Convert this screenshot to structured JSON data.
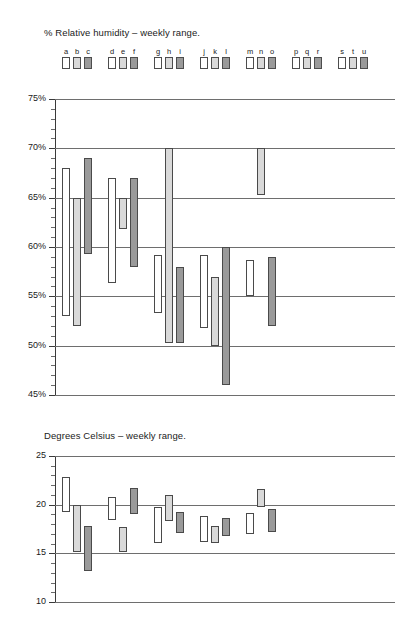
{
  "page": {
    "background": "#ffffff",
    "width": 405,
    "height": 622
  },
  "legend": {
    "name": "series-legend",
    "groups": [
      {
        "letters": [
          "a",
          "b",
          "c"
        ]
      },
      {
        "letters": [
          "d",
          "e",
          "f"
        ]
      },
      {
        "letters": [
          "g",
          "h",
          "i"
        ]
      },
      {
        "letters": [
          "j",
          "k",
          "l"
        ]
      },
      {
        "letters": [
          "m",
          "n",
          "o"
        ]
      },
      {
        "letters": [
          "p",
          "q",
          "r"
        ]
      },
      {
        "letters": [
          "s",
          "t",
          "u"
        ]
      }
    ],
    "swatch_colors": [
      "#ffffff",
      "#d9d9d9",
      "#9a9a9a"
    ],
    "swatch_border": "#4d4d4d"
  },
  "colors": {
    "white_series": "#ffffff",
    "light_series": "#d9d9d9",
    "dark_series": "#9a9a9a",
    "bar_border": "#4a4a4a",
    "gridline": "#6e6e6e",
    "axis": "#3a3a3a",
    "text": "#1a1a1a"
  },
  "chart_data": [
    {
      "id": "humidity",
      "type": "bar",
      "title": "% Relative humidity – weekly range.",
      "xlabel": "",
      "ylabel": "",
      "ylim": [
        45,
        75
      ],
      "ytick_labels": [
        "75%",
        "70%",
        "65%",
        "60%",
        "55%",
        "50%",
        "45%"
      ],
      "ytick_values": [
        75,
        70,
        65,
        60,
        55,
        50,
        45
      ],
      "yminor_step": 1,
      "grid": true,
      "legend_position": "top",
      "note": "Floating range bars: each bar spans from its low to its high value. Categories p, q, r, s, t, u have no data plotted.",
      "categories": [
        "a",
        "b",
        "c",
        "d",
        "e",
        "f",
        "g",
        "h",
        "i",
        "j",
        "k",
        "l",
        "m",
        "n",
        "o",
        "p",
        "q",
        "r",
        "s",
        "t",
        "u"
      ],
      "series_colors": {
        "a": "#ffffff",
        "b": "#d9d9d9",
        "c": "#9a9a9a",
        "d": "#ffffff",
        "e": "#d9d9d9",
        "f": "#9a9a9a",
        "g": "#ffffff",
        "h": "#d9d9d9",
        "i": "#9a9a9a",
        "j": "#ffffff",
        "k": "#d9d9d9",
        "l": "#9a9a9a",
        "m": "#ffffff",
        "n": "#d9d9d9",
        "o": "#9a9a9a",
        "p": "#ffffff",
        "q": "#d9d9d9",
        "r": "#9a9a9a",
        "s": "#ffffff",
        "t": "#d9d9d9",
        "u": "#9a9a9a"
      },
      "ranges": [
        {
          "category": "a",
          "low": 53.0,
          "high": 68.0,
          "color": "#ffffff"
        },
        {
          "category": "b",
          "low": 52.0,
          "high": 65.0,
          "color": "#d9d9d9"
        },
        {
          "category": "c",
          "low": 59.3,
          "high": 69.0,
          "color": "#9a9a9a"
        },
        {
          "category": "d",
          "low": 56.3,
          "high": 67.0,
          "color": "#ffffff"
        },
        {
          "category": "e",
          "low": 61.8,
          "high": 65.0,
          "color": "#d9d9d9"
        },
        {
          "category": "f",
          "low": 58.0,
          "high": 67.0,
          "color": "#9a9a9a"
        },
        {
          "category": "g",
          "low": 53.3,
          "high": 59.2,
          "color": "#ffffff"
        },
        {
          "category": "h",
          "low": 50.3,
          "high": 70.0,
          "color": "#d9d9d9"
        },
        {
          "category": "i",
          "low": 50.3,
          "high": 58.0,
          "color": "#9a9a9a"
        },
        {
          "category": "j",
          "low": 51.8,
          "high": 59.2,
          "color": "#ffffff"
        },
        {
          "category": "k",
          "low": 50.0,
          "high": 57.0,
          "color": "#d9d9d9"
        },
        {
          "category": "l",
          "low": 46.0,
          "high": 60.0,
          "color": "#9a9a9a"
        },
        {
          "category": "m",
          "low": 55.0,
          "high": 58.7,
          "color": "#ffffff"
        },
        {
          "category": "n",
          "low": 65.3,
          "high": 70.0,
          "color": "#d9d9d9"
        },
        {
          "category": "o",
          "low": 52.0,
          "high": 59.0,
          "color": "#9a9a9a"
        }
      ]
    },
    {
      "id": "celsius",
      "type": "bar",
      "title": "Degrees Celsius – weekly range.",
      "xlabel": "",
      "ylabel": "",
      "ylim": [
        10,
        25
      ],
      "ytick_labels": [
        "25",
        "20",
        "15",
        "10"
      ],
      "ytick_values": [
        25,
        20,
        15,
        10
      ],
      "yminor_step": 1,
      "grid": true,
      "legend_position": "none",
      "note": "Floating range bars aligned to the same a–u category positions as the humidity chart. Categories s, t, u have no data plotted.",
      "categories": [
        "a",
        "b",
        "c",
        "d",
        "e",
        "f",
        "g",
        "h",
        "i",
        "j",
        "k",
        "l",
        "m",
        "n",
        "o",
        "p",
        "q",
        "r",
        "s",
        "t",
        "u"
      ],
      "ranges": [
        {
          "category": "a",
          "low": 19.2,
          "high": 22.8,
          "color": "#ffffff"
        },
        {
          "category": "b",
          "low": 15.1,
          "high": 20.0,
          "color": "#d9d9d9"
        },
        {
          "category": "c",
          "low": 13.2,
          "high": 17.8,
          "color": "#9a9a9a"
        },
        {
          "category": "d",
          "low": 18.4,
          "high": 20.8,
          "color": "#ffffff"
        },
        {
          "category": "e",
          "low": 15.1,
          "high": 17.7,
          "color": "#d9d9d9"
        },
        {
          "category": "f",
          "low": 19.0,
          "high": 21.7,
          "color": "#9a9a9a"
        },
        {
          "category": "g",
          "low": 16.1,
          "high": 19.8,
          "color": "#ffffff"
        },
        {
          "category": "h",
          "low": 18.3,
          "high": 21.0,
          "color": "#d9d9d9"
        },
        {
          "category": "i",
          "low": 17.1,
          "high": 19.2,
          "color": "#9a9a9a"
        },
        {
          "category": "j",
          "low": 16.2,
          "high": 18.8,
          "color": "#ffffff"
        },
        {
          "category": "k",
          "low": 16.1,
          "high": 17.8,
          "color": "#d9d9d9"
        },
        {
          "category": "l",
          "low": 16.8,
          "high": 18.6,
          "color": "#9a9a9a"
        },
        {
          "category": "m",
          "low": 17.0,
          "high": 19.1,
          "color": "#ffffff"
        },
        {
          "category": "n",
          "low": 19.8,
          "high": 21.6,
          "color": "#d9d9d9"
        },
        {
          "category": "o",
          "low": 17.2,
          "high": 19.6,
          "color": "#9a9a9a"
        }
      ]
    }
  ]
}
